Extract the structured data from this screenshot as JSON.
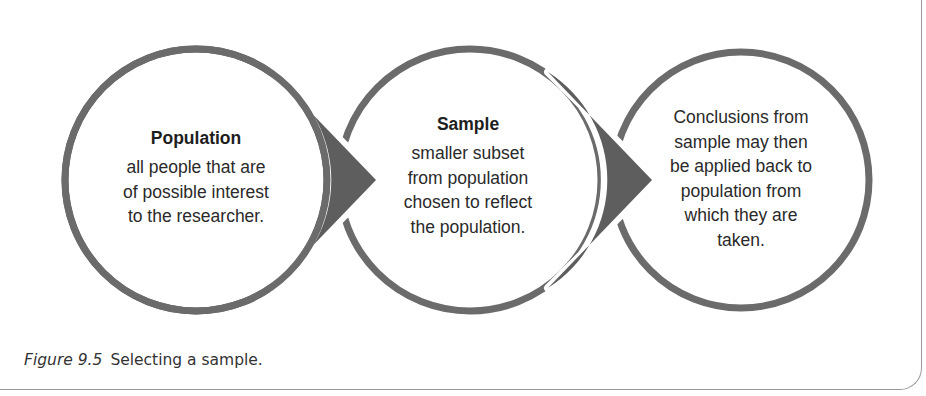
{
  "colors": {
    "ring": "#6b6b6b",
    "arrow": "#5e5e5e",
    "text": "#2a2a2a",
    "background": "#ffffff",
    "frame": "#9a9a9a"
  },
  "diagram": {
    "circles": [
      {
        "title": "Population",
        "lines": [
          "all people that are",
          "of possible interest",
          "to the researcher."
        ]
      },
      {
        "title": "Sample",
        "lines": [
          "smaller subset",
          "from population",
          "chosen to reflect",
          "the population."
        ]
      },
      {
        "title": "",
        "lines": [
          "Conclusions from",
          "sample may then",
          "be applied back to",
          "population from",
          "which they are",
          "taken."
        ]
      }
    ],
    "arrows": [
      {
        "from": "Population",
        "to": "Sample",
        "icon": "arrow-right-wedge"
      },
      {
        "from": "Sample",
        "to": "Conclusions",
        "icon": "arrow-right-wedge"
      }
    ]
  },
  "caption": {
    "label": "Figure 9.5",
    "text": "Selecting a sample."
  }
}
